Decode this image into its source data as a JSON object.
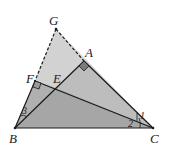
{
  "diagram": {
    "points": {
      "B": {
        "label": "B",
        "x": 15,
        "y": 128
      },
      "C": {
        "label": "C",
        "x": 153,
        "y": 128
      },
      "G": {
        "label": "G",
        "x": 56,
        "y": 29
      },
      "A": {
        "label": "A",
        "x": 84,
        "y": 61
      },
      "F": {
        "label": "F",
        "x": 35,
        "y": 81
      },
      "E": {
        "label": "E",
        "x": 56,
        "y": 88
      }
    },
    "angles": {
      "angle1": "1",
      "angle2": "2",
      "angle3": "3"
    },
    "colors": {
      "light_fill": "#cfcfcf",
      "mid_fill": "#b4b4b4",
      "dark_fill": "#8e8e8e",
      "line": "#1a1a1a",
      "right_angle_fill": "#7a7a7a"
    }
  }
}
